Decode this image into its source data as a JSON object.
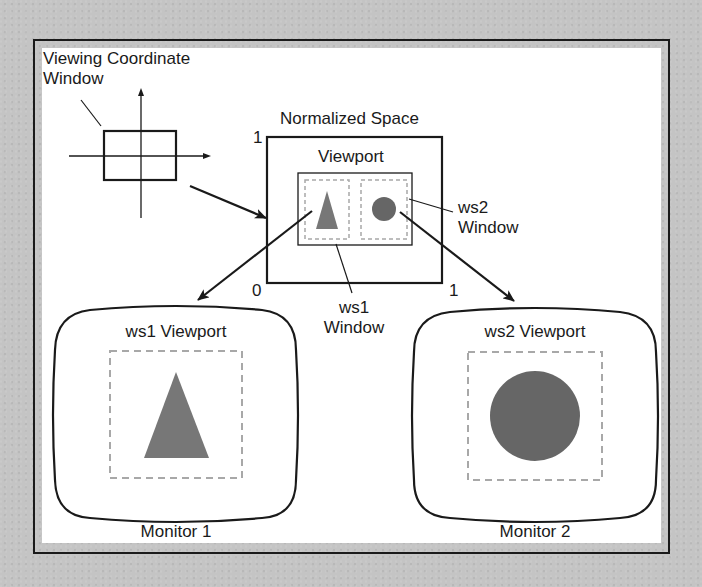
{
  "diagram": {
    "colors": {
      "background": "#c4c4c4",
      "canvas": "#ffffff",
      "stroke": "#1a1a1a",
      "dashed": "#a8a8a8",
      "triangle_fill": "#777777",
      "circle_fill": "#666666"
    },
    "viewing_coordinate": {
      "label_line1": "Viewing Coordinate",
      "label_line2": "Window"
    },
    "normalized_space": {
      "label": "Normalized Space",
      "axis_top_left": "1",
      "axis_origin": "0",
      "axis_bottom_right": "1",
      "viewport_label": "Viewport"
    },
    "ws1_window": {
      "label_line1": "ws1",
      "label_line2": "Window"
    },
    "ws2_window": {
      "label_line1": "ws2",
      "label_line2": "Window"
    },
    "monitors": [
      {
        "viewport_label": "ws1 Viewport",
        "caption": "Monitor 1",
        "shape": "triangle"
      },
      {
        "viewport_label": "ws2 Viewport",
        "caption": "Monitor 2",
        "shape": "circle"
      }
    ]
  }
}
